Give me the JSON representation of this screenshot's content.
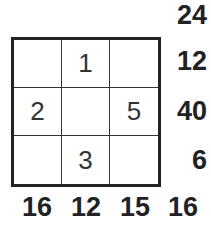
{
  "puzzle": {
    "grid": [
      [
        "",
        "1",
        ""
      ],
      [
        "2",
        "",
        "5"
      ],
      [
        "",
        "3",
        ""
      ]
    ],
    "corner_top_sum": "24",
    "row_sums": [
      "12",
      "40",
      "6"
    ],
    "column_sums": [
      "16",
      "12",
      "15"
    ],
    "diagonal_sum": "16"
  }
}
